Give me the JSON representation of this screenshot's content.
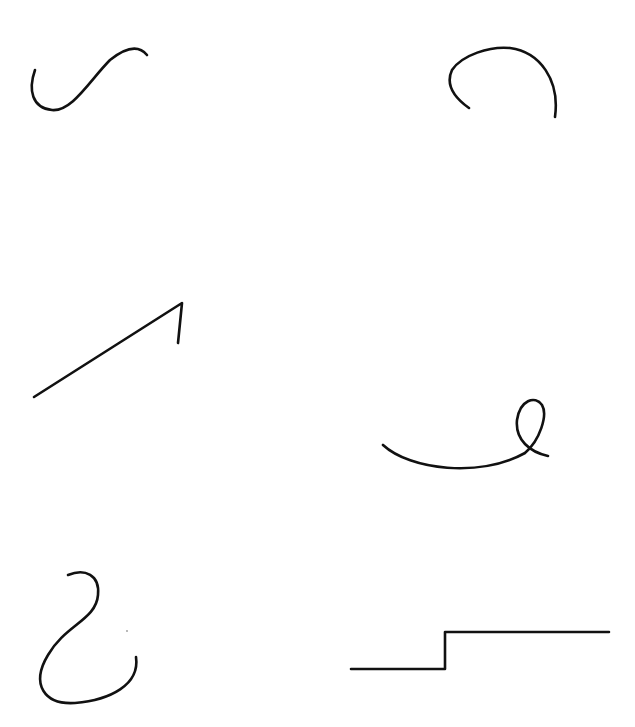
{
  "page": {
    "background": "#ffffff",
    "width": 635,
    "height": 727
  },
  "style": {
    "stroke_color": "#111111",
    "stroke_width": 2.6
  },
  "strokes": [
    {
      "id": "s-curve",
      "d": "M 35 70 C 28 90, 32 108, 52 110 C 72 112, 90 80, 110 60 C 125 48, 138 44, 147 55"
    },
    {
      "id": "open-arc",
      "d": "M 469 108 C 455 98, 445 85, 452 70 C 462 55, 490 46, 510 48 C 540 52, 560 80, 555 117"
    },
    {
      "id": "angle-line",
      "d": "M 34 397 L 182 303 L 178 343"
    },
    {
      "id": "loop-curve",
      "d": "M 383 445 C 410 470, 480 478, 525 453 C 540 440, 548 415, 542 405 C 535 395, 520 400, 517 420 C 515 440, 530 452, 548 456"
    },
    {
      "id": "hook-curve",
      "d": "M 68 575 C 85 568, 100 575, 98 595 C 96 620, 65 625, 48 655 C 30 685, 45 705, 75 703 C 110 700, 140 685, 136 657"
    },
    {
      "id": "step-line",
      "d": "M 351 669 L 445 669 L 445 632 L 609 632"
    }
  ],
  "specks": [
    {
      "cx": 127,
      "cy": 631,
      "r": 0.9
    }
  ]
}
